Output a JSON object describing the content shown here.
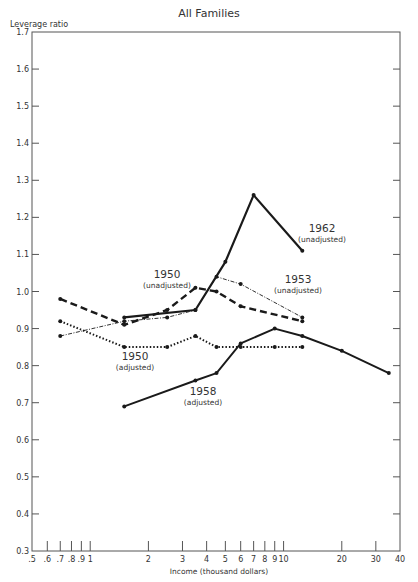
{
  "title": "All Families",
  "chart_data": {
    "type": "line",
    "title": "All Families",
    "xlabel": "Income (thousand dollars)",
    "ylabel": "Leverage ratio",
    "xscale": "log",
    "xlim": [
      0.5,
      40
    ],
    "ylim": [
      0.3,
      1.7
    ],
    "x_ticks": [
      0.5,
      0.6,
      0.7,
      0.8,
      0.9,
      1,
      2,
      3,
      4,
      5,
      6,
      7,
      8,
      9,
      10,
      20,
      30,
      40
    ],
    "x_tick_labels": [
      ".5",
      ".6",
      ".7",
      ".8",
      ".9",
      "1",
      "2",
      "3",
      "4",
      "5",
      "6",
      "7",
      "8",
      "9",
      "10",
      "20",
      "30",
      "40"
    ],
    "y_ticks": [
      0.3,
      0.4,
      0.5,
      0.6,
      0.7,
      0.8,
      0.9,
      1.0,
      1.1,
      1.2,
      1.3,
      1.4,
      1.5,
      1.6,
      1.7
    ],
    "y_tick_labels": [
      "0.3",
      "0.4",
      "0.5",
      "0.6",
      "0.7",
      "0.8",
      "0.9",
      "1.0",
      "1.1",
      "1.2",
      "1.3",
      "1.4",
      "1.5",
      "1.6",
      "1.7"
    ],
    "grid": false,
    "legend": "inline annotations",
    "series": [
      {
        "name": "1950 (unadjusted)",
        "style": "heavy-dashed",
        "x": [
          0.7,
          1.5,
          2.5,
          3.5,
          4.5,
          6,
          12.5
        ],
        "values": [
          0.98,
          0.91,
          0.95,
          1.01,
          1.0,
          0.96,
          0.92
        ]
      },
      {
        "name": "1950 (adjusted)",
        "style": "dotted",
        "x": [
          0.7,
          1.5,
          2.5,
          3.5,
          4.5,
          6,
          9,
          12.5
        ],
        "values": [
          0.92,
          0.85,
          0.85,
          0.88,
          0.85,
          0.85,
          0.85,
          0.85
        ]
      },
      {
        "name": "1953 (unadjusted)",
        "style": "thin-dash-dot",
        "x": [
          0.7,
          1.5,
          2.5,
          3.5,
          4.5,
          6,
          12.5
        ],
        "values": [
          0.88,
          0.92,
          0.93,
          0.95,
          1.04,
          1.02,
          0.93
        ]
      },
      {
        "name": "1962 (unadjusted)",
        "style": "heavy-solid",
        "x": [
          1.5,
          3.5,
          5,
          7,
          12.5
        ],
        "values": [
          0.93,
          0.95,
          1.08,
          1.26,
          1.11
        ]
      },
      {
        "name": "1958 (adjusted)",
        "style": "solid",
        "x": [
          1.5,
          3.5,
          4.5,
          6,
          9,
          12.5,
          20,
          35
        ],
        "values": [
          0.69,
          0.76,
          0.78,
          0.86,
          0.9,
          0.88,
          0.84,
          0.78
        ]
      }
    ],
    "annotations": [
      {
        "year": "1962",
        "note": "(unadjusted)",
        "x_px": 322,
        "y_px": 232
      },
      {
        "year": "1953",
        "note": "(unadjusted)",
        "x_px": 298,
        "y_px": 283
      },
      {
        "year": "1950",
        "note": "(unadjusted)",
        "x_px": 167,
        "y_px": 278
      },
      {
        "year": "1950",
        "note": "(adjusted)",
        "x_px": 135,
        "y_px": 360
      },
      {
        "year": "1958",
        "note": "(adjusted)",
        "x_px": 203,
        "y_px": 395
      }
    ]
  }
}
